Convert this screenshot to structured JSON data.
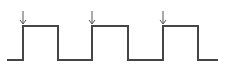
{
  "diagram": {
    "type": "square-wave-timing",
    "colors": {
      "wave": "#454545",
      "arrow": "#555555",
      "background": "#ffffff"
    },
    "levels": {
      "low_y": 60,
      "high_y": 26
    },
    "wave_points": "7,60 23,60 23,26 58,26 58,60 92,60 92,26 128,26 128,60 163,60 163,26 198,26 198,60 218,60",
    "edge_markers": [
      {
        "label": "rising-edge-1",
        "x": 23
      },
      {
        "label": "rising-edge-2",
        "x": 92
      },
      {
        "label": "rising-edge-3",
        "x": 163
      }
    ]
  }
}
